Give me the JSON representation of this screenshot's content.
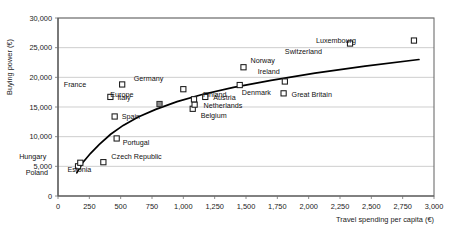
{
  "chart_data": {
    "type": "scatter",
    "title": "",
    "xlabel": "Travel spending per capita (€)",
    "ylabel": "Buying power (€)",
    "xlim": [
      0,
      3000
    ],
    "ylim": [
      0,
      30000
    ],
    "xticks": [
      "0",
      "250",
      "500",
      "750",
      "1,000",
      "1,250",
      "1,500",
      "1,750",
      "2,000",
      "2,250",
      "2,500",
      "2,750",
      "3,000"
    ],
    "xtick_values": [
      0,
      250,
      500,
      750,
      1000,
      1250,
      1500,
      1750,
      2000,
      2250,
      2500,
      2750,
      3000
    ],
    "yticks": [
      "0",
      "5,000",
      "10,000",
      "15,000",
      "20,000",
      "25,000",
      "30,000"
    ],
    "ytick_values": [
      0,
      5000,
      10000,
      15000,
      20000,
      25000,
      30000
    ],
    "grid": "horizontal",
    "legend": "none",
    "marker_style": "open-square",
    "points": [
      {
        "name": "Poland",
        "x": 160,
        "y": 5000,
        "label_dx": -30,
        "label_dy": 9,
        "marker": "open"
      },
      {
        "name": "Hungary",
        "x": 178,
        "y": 5600,
        "label_dx": -34,
        "label_dy": -4,
        "marker": "open"
      },
      {
        "name": "Estonia",
        "x": 362,
        "y": 5700,
        "label_dx": -12,
        "label_dy": 10,
        "marker": "open"
      },
      {
        "name": "Czech Republic",
        "x": 362,
        "y": 5700,
        "label_dx": 8,
        "label_dy": -3,
        "marker": "none"
      },
      {
        "name": "Portugal",
        "x": 468,
        "y": 9700,
        "label_dx": 6,
        "label_dy": 7,
        "marker": "open"
      },
      {
        "name": "Spain",
        "x": 452,
        "y": 13400,
        "label_dx": 7,
        "label_dy": 3,
        "marker": "open"
      },
      {
        "name": "Italy",
        "x": 418,
        "y": 16700,
        "label_dx": 7,
        "label_dy": 3,
        "marker": "open"
      },
      {
        "name": "France",
        "x": 512,
        "y": 18800,
        "label_dx": -36,
        "label_dy": 3,
        "marker": "open"
      },
      {
        "name": "Europe",
        "x": 810,
        "y": 15500,
        "label_dx": -26,
        "label_dy": -7,
        "marker": "filled"
      },
      {
        "name": "Germany",
        "x": 1000,
        "y": 18000,
        "label_dx": -20,
        "label_dy": -8,
        "marker": "open"
      },
      {
        "name": "Belgium",
        "x": 1075,
        "y": 14700,
        "label_dx": 8,
        "label_dy": 9,
        "marker": "open"
      },
      {
        "name": "Netherlands",
        "x": 1090,
        "y": 15400,
        "label_dx": 9,
        "label_dy": 3,
        "marker": "open"
      },
      {
        "name": "Finland",
        "x": 1085,
        "y": 16300,
        "label_dx": 9,
        "label_dy": -2,
        "marker": "open"
      },
      {
        "name": "Austria",
        "x": 1175,
        "y": 16700,
        "label_dx": 8,
        "label_dy": 3,
        "marker": "open"
      },
      {
        "name": "Denmark",
        "x": 1450,
        "y": 18700,
        "label_dx": 2,
        "label_dy": 10,
        "marker": "open"
      },
      {
        "name": "Norway",
        "x": 1480,
        "y": 21700,
        "label_dx": 7,
        "label_dy": -4,
        "marker": "open"
      },
      {
        "name": "Great Britain",
        "x": 1800,
        "y": 17300,
        "label_dx": 8,
        "label_dy": 4,
        "marker": "open"
      },
      {
        "name": "Ireland",
        "x": 1810,
        "y": 19300,
        "label_dx": -5,
        "label_dy": -7,
        "marker": "open"
      },
      {
        "name": "Switzerland",
        "x": 2330,
        "y": 25700,
        "label_dx": -28,
        "label_dy": 10,
        "marker": "open"
      },
      {
        "name": "Luxembourg",
        "x": 2840,
        "y": 26200,
        "label_dx": -58,
        "label_dy": 2,
        "marker": "open"
      }
    ],
    "trend": {
      "name": "logarithmic trendline",
      "points": [
        {
          "x": 150,
          "y": 3900
        },
        {
          "x": 200,
          "y": 5700
        },
        {
          "x": 260,
          "y": 7200
        },
        {
          "x": 330,
          "y": 8700
        },
        {
          "x": 420,
          "y": 10400
        },
        {
          "x": 520,
          "y": 11900
        },
        {
          "x": 640,
          "y": 13300
        },
        {
          "x": 780,
          "y": 14600
        },
        {
          "x": 950,
          "y": 15900
        },
        {
          "x": 1150,
          "y": 17100
        },
        {
          "x": 1400,
          "y": 18300
        },
        {
          "x": 1700,
          "y": 19500
        },
        {
          "x": 2050,
          "y": 20700
        },
        {
          "x": 2450,
          "y": 21900
        },
        {
          "x": 2880,
          "y": 23000
        }
      ]
    }
  },
  "colors": {
    "grid": "#b9b9b9",
    "border": "#6e6e6e",
    "trend": "#000000",
    "marker_fill": "#ffffff",
    "marker_stroke": "#1a1a1a",
    "europe_fill": "#8c8c8c",
    "text": "#1a1a1a",
    "background": "#ffffff"
  }
}
